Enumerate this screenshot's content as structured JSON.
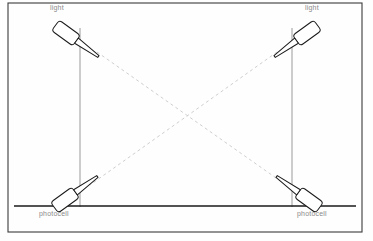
{
  "diagram": {
    "background_color": "#fefefe",
    "frame": {
      "stroke": "#3a3a3a",
      "x": 8,
      "y": 3,
      "width": 354,
      "height": 229
    },
    "ground_line": {
      "stroke": "#1a1a1a",
      "x1": 14,
      "y1": 206,
      "x2": 356,
      "y2": 206
    },
    "poles": [
      {
        "name": "pole-left",
        "stroke": "#9a9a9a",
        "x": 80,
        "y_top": 28,
        "y_bottom": 207
      },
      {
        "name": "pole-right",
        "stroke": "#9a9a9a",
        "x": 292,
        "y_top": 28,
        "y_bottom": 207
      }
    ],
    "beams": {
      "stroke": "#c8c8c8",
      "dash": "3 3",
      "crossing_point": {
        "x": 188,
        "y": 122
      },
      "paths": [
        {
          "name": "beam-top-left-to-bottom-right",
          "x1": 97,
          "y1": 52,
          "x2": 286,
          "y2": 185
        },
        {
          "name": "beam-top-right-to-bottom-left",
          "x1": 277,
          "y1": 52,
          "x2": 90,
          "y2": 185
        }
      ]
    },
    "fixtures": [
      {
        "name": "light-top-left",
        "kind": "light",
        "head_center": {
          "x": 66,
          "y": 33
        },
        "angle_deg": 36,
        "stroke": "#1a1a1a"
      },
      {
        "name": "light-top-right",
        "kind": "light",
        "head_center": {
          "x": 307,
          "y": 33
        },
        "angle_deg": -36,
        "stroke": "#1a1a1a"
      },
      {
        "name": "photocell-bottom-left",
        "kind": "photocell",
        "head_center": {
          "x": 65,
          "y": 200
        },
        "angle_deg": -36,
        "stroke": "#1a1a1a"
      },
      {
        "name": "photocell-bottom-right",
        "kind": "photocell",
        "head_center": {
          "x": 309,
          "y": 200
        },
        "angle_deg": 36,
        "stroke": "#1a1a1a"
      }
    ]
  },
  "labels": {
    "light_left": "light",
    "light_right": "light",
    "photocell_left": "photocell",
    "photocell_right": "photocell",
    "color": "#8a8a8a"
  }
}
